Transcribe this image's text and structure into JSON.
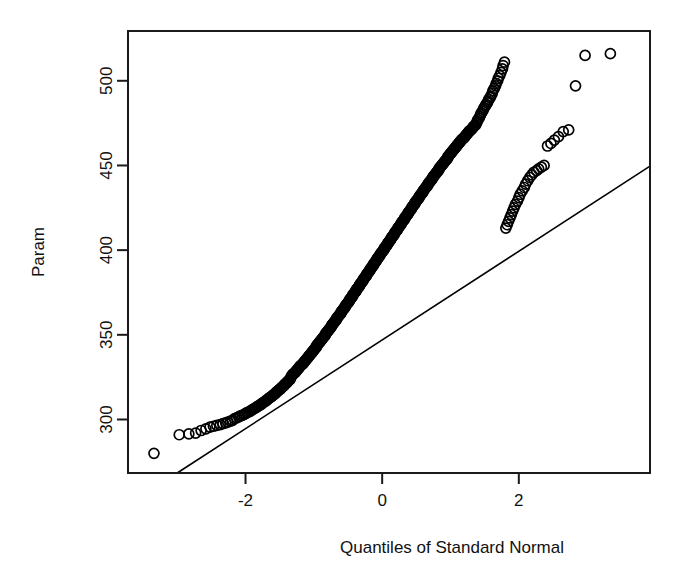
{
  "figure": {
    "background": "#ffffff",
    "ink_color": "#000000",
    "width": 687,
    "height": 584
  },
  "chart_data": {
    "type": "scatter",
    "title": "",
    "subtitle": "",
    "xlabel": "Quantiles of Standard Normal",
    "ylabel": "Param",
    "xlim": [
      -3.72,
      3.92
    ],
    "ylim": [
      268.4,
      529.4
    ],
    "xticks": [
      -2,
      0,
      2
    ],
    "xtick_labels": [
      "-2",
      "0",
      "2"
    ],
    "yticks": [
      300,
      350,
      400,
      450,
      500
    ],
    "ytick_labels": [
      "300",
      "350",
      "400",
      "450",
      "500"
    ],
    "grid": false,
    "legend": null,
    "marker": {
      "shape": "open-circle",
      "radius_px": 5,
      "fill": "none",
      "stroke": "#000000"
    },
    "reference_line": {
      "description": "qqline through first and third quartiles",
      "x_endpoints": [
        -3.0,
        3.92
      ],
      "y_endpoints": [
        268.4,
        449.6
      ],
      "slope": 26.15,
      "intercept": 346.9,
      "color": "#000000"
    },
    "annotations": [],
    "n_points": 360,
    "series": [
      {
        "name": "Param sample quantiles",
        "x": [
          -3.34,
          -2.97,
          -2.83,
          -2.73,
          -2.65,
          -2.58,
          -2.52,
          -2.47,
          -2.42,
          -2.37,
          -2.33,
          -2.29,
          -2.26,
          -2.22,
          -2.19,
          -2.16,
          -2.13,
          -2.1,
          -2.08,
          -2.05,
          -2.02,
          -2.0,
          -1.98,
          -1.95,
          -1.93,
          -1.91,
          -1.89,
          -1.87,
          -1.85,
          -1.83,
          -1.81,
          -1.79,
          -1.77,
          -1.76,
          -1.74,
          -1.72,
          -1.7,
          -1.69,
          -1.67,
          -1.66,
          -1.64,
          -1.62,
          -1.61,
          -1.59,
          -1.58,
          -1.56,
          -1.55,
          -1.54,
          -1.52,
          -1.51,
          -1.49,
          -1.48,
          -1.47,
          -1.45,
          -1.44,
          -1.43,
          -1.42,
          -1.4,
          -1.39,
          -1.38,
          -1.37,
          -1.35,
          -1.34,
          -1.33,
          -1.32,
          -1.31,
          -1.3,
          -1.28,
          -1.27,
          -1.26,
          -1.25,
          -1.24,
          -1.23,
          -1.22,
          -1.21,
          -1.2,
          -1.19,
          -1.17,
          -1.16,
          -1.15,
          -1.14,
          -1.13,
          -1.12,
          -1.11,
          -1.1,
          -1.09,
          -1.08,
          -1.07,
          -1.06,
          -1.05,
          -1.04,
          -1.03,
          -1.02,
          -1.01,
          -1.0,
          -0.99,
          -0.98,
          -0.97,
          -0.96,
          -0.96,
          -0.95,
          -0.94,
          -0.93,
          -0.92,
          -0.91,
          -0.9,
          -0.89,
          -0.88,
          -0.87,
          -0.86,
          -0.85,
          -0.84,
          -0.83,
          -0.83,
          -0.82,
          -0.81,
          -0.8,
          -0.79,
          -0.78,
          -0.77,
          -0.76,
          -0.75,
          -0.74,
          -0.74,
          -0.73,
          -0.72,
          -0.71,
          -0.7,
          -0.69,
          -0.68,
          -0.67,
          -0.67,
          -0.66,
          -0.65,
          -0.64,
          -0.63,
          -0.62,
          -0.61,
          -0.6,
          -0.6,
          -0.59,
          -0.58,
          -0.57,
          -0.56,
          -0.55,
          -0.54,
          -0.54,
          -0.53,
          -0.52,
          -0.51,
          -0.5,
          -0.49,
          -0.48,
          -0.48,
          -0.47,
          -0.46,
          -0.45,
          -0.44,
          -0.43,
          -0.43,
          -0.42,
          -0.41,
          -0.4,
          -0.39,
          -0.38,
          -0.38,
          -0.37,
          -0.36,
          -0.35,
          -0.34,
          -0.33,
          -0.33,
          -0.32,
          -0.31,
          -0.3,
          -0.29,
          -0.28,
          -0.28,
          -0.27,
          -0.26,
          -0.25,
          -0.24,
          -0.23,
          -0.23,
          -0.22,
          -0.21,
          -0.2,
          -0.19,
          -0.18,
          -0.18,
          -0.17,
          -0.16,
          -0.15,
          -0.14,
          -0.13,
          -0.13,
          -0.12,
          -0.11,
          -0.1,
          -0.09,
          -0.08,
          -0.08,
          -0.07,
          -0.06,
          -0.05,
          -0.04,
          -0.03,
          -0.03,
          -0.02,
          -0.01,
          0.0,
          0.01,
          0.02,
          0.03,
          0.03,
          0.04,
          0.05,
          0.06,
          0.07,
          0.08,
          0.08,
          0.09,
          0.1,
          0.11,
          0.12,
          0.13,
          0.13,
          0.14,
          0.15,
          0.16,
          0.17,
          0.18,
          0.18,
          0.19,
          0.2,
          0.21,
          0.22,
          0.23,
          0.23,
          0.24,
          0.25,
          0.26,
          0.27,
          0.28,
          0.28,
          0.29,
          0.3,
          0.31,
          0.32,
          0.33,
          0.33,
          0.34,
          0.35,
          0.36,
          0.37,
          0.38,
          0.38,
          0.39,
          0.4,
          0.41,
          0.42,
          0.43,
          0.43,
          0.44,
          0.45,
          0.46,
          0.47,
          0.48,
          0.48,
          0.49,
          0.5,
          0.51,
          0.52,
          0.53,
          0.54,
          0.54,
          0.55,
          0.56,
          0.57,
          0.58,
          0.59,
          0.6,
          0.6,
          0.61,
          0.62,
          0.63,
          0.64,
          0.65,
          0.66,
          0.67,
          0.67,
          0.68,
          0.69,
          0.7,
          0.71,
          0.72,
          0.73,
          0.74,
          0.74,
          0.75,
          0.76,
          0.77,
          0.78,
          0.79,
          0.8,
          0.81,
          0.82,
          0.83,
          0.83,
          0.84,
          0.85,
          0.86,
          0.87,
          0.88,
          0.89,
          0.9,
          0.91,
          0.92,
          0.93,
          0.94,
          0.95,
          0.96,
          0.96,
          0.97,
          0.98,
          0.99,
          1.0,
          1.01,
          1.02,
          1.03,
          1.04,
          1.05,
          1.06,
          1.07,
          1.08,
          1.09,
          1.1,
          1.11,
          1.12,
          1.13,
          1.14,
          1.15,
          1.16,
          1.17,
          1.19,
          1.2,
          1.21,
          1.22,
          1.23,
          1.24,
          1.25,
          1.26,
          1.27,
          1.28,
          1.3,
          1.31,
          1.32,
          1.33,
          1.34,
          1.35,
          1.37,
          1.38,
          1.39,
          1.4,
          1.42,
          1.43,
          1.44,
          1.45,
          1.47,
          1.48,
          1.49,
          1.51,
          1.52,
          1.54,
          1.55,
          1.56,
          1.58,
          1.59,
          1.61,
          1.62,
          1.64,
          1.66,
          1.67,
          1.69,
          1.7,
          1.72,
          1.74,
          1.76,
          1.77,
          1.79,
          1.81,
          1.83,
          1.85,
          1.87,
          1.89,
          1.91,
          1.93,
          1.95,
          1.98,
          2.0,
          2.02,
          2.05,
          2.08,
          2.1,
          2.13,
          2.16,
          2.19,
          2.22,
          2.26,
          2.29,
          2.33,
          2.37,
          2.42,
          2.47,
          2.52,
          2.58,
          2.65,
          2.73,
          2.83,
          2.97,
          3.34
        ],
        "y": [
          280.0,
          291.0,
          291.5,
          292.0,
          293.5,
          294.5,
          295.5,
          296.0,
          296.5,
          297.0,
          297.5,
          298.0,
          298.5,
          299.0,
          299.5,
          300.5,
          301.0,
          301.5,
          302.0,
          302.5,
          303.0,
          303.5,
          304.0,
          304.5,
          305.0,
          305.5,
          306.0,
          306.5,
          307.0,
          307.5,
          308.0,
          308.5,
          309.0,
          309.5,
          310.0,
          310.5,
          311.0,
          311.5,
          312.0,
          312.5,
          313.0,
          313.5,
          314.0,
          314.5,
          315.0,
          315.5,
          316.0,
          316.5,
          317.0,
          317.5,
          318.0,
          318.5,
          319.0,
          319.5,
          320.0,
          320.5,
          321.0,
          321.5,
          322.0,
          322.5,
          323.0,
          323.5,
          324.5,
          325.5,
          326.0,
          326.5,
          327.0,
          327.5,
          328.0,
          328.5,
          329.0,
          329.5,
          330.0,
          330.5,
          331.0,
          331.5,
          332.0,
          332.5,
          333.0,
          333.5,
          334.0,
          334.5,
          335.0,
          335.5,
          336.0,
          336.5,
          337.0,
          337.5,
          338.0,
          338.5,
          339.0,
          339.5,
          340.0,
          340.5,
          341.0,
          341.5,
          342.0,
          342.5,
          343.0,
          343.5,
          344.0,
          344.5,
          345.0,
          345.5,
          346.0,
          346.5,
          347.0,
          347.5,
          348.0,
          348.5,
          349.0,
          349.5,
          350.0,
          350.5,
          351.0,
          351.5,
          352.0,
          352.5,
          353.0,
          353.5,
          354.0,
          354.5,
          355.0,
          355.5,
          356.0,
          356.5,
          357.0,
          357.5,
          358.0,
          358.5,
          359.0,
          359.5,
          360.0,
          360.5,
          361.0,
          361.5,
          362.0,
          362.5,
          363.0,
          363.5,
          364.0,
          364.5,
          365.0,
          365.5,
          366.0,
          366.5,
          367.0,
          367.5,
          368.0,
          368.5,
          369.0,
          369.5,
          370.0,
          370.5,
          371.0,
          371.5,
          372.0,
          372.5,
          373.0,
          373.5,
          374.0,
          374.5,
          375.0,
          375.5,
          376.0,
          376.5,
          377.0,
          377.5,
          378.0,
          378.5,
          379.0,
          379.5,
          380.0,
          380.5,
          381.0,
          381.5,
          382.0,
          382.5,
          383.0,
          383.5,
          384.0,
          384.5,
          385.0,
          385.5,
          386.0,
          386.5,
          387.0,
          387.5,
          388.0,
          388.5,
          389.0,
          389.5,
          390.0,
          390.5,
          391.0,
          391.5,
          392.0,
          392.5,
          393.0,
          393.5,
          394.0,
          394.5,
          395.0,
          395.5,
          396.0,
          396.5,
          397.0,
          397.5,
          398.0,
          398.5,
          399.0,
          399.5,
          400.0,
          400.5,
          401.0,
          401.5,
          402.0,
          402.5,
          403.0,
          403.5,
          404.0,
          404.5,
          405.0,
          405.5,
          406.0,
          406.5,
          407.0,
          407.5,
          408.0,
          408.5,
          409.0,
          409.5,
          410.0,
          410.5,
          411.0,
          411.5,
          412.0,
          412.5,
          413.0,
          413.5,
          414.0,
          414.5,
          415.0,
          415.5,
          416.0,
          416.5,
          417.0,
          417.5,
          418.0,
          418.5,
          419.0,
          419.5,
          420.0,
          420.5,
          421.0,
          421.5,
          422.0,
          422.5,
          423.0,
          423.5,
          424.0,
          424.5,
          425.0,
          425.5,
          426.0,
          426.5,
          427.0,
          427.5,
          428.0,
          428.5,
          429.0,
          429.5,
          430.0,
          430.5,
          431.0,
          431.5,
          432.0,
          432.5,
          433.0,
          433.5,
          434.0,
          434.5,
          435.0,
          435.5,
          436.0,
          436.5,
          437.0,
          437.5,
          438.0,
          438.5,
          439.0,
          439.5,
          440.0,
          440.5,
          441.0,
          441.5,
          442.0,
          442.5,
          443.0,
          443.5,
          444.0,
          444.5,
          445.0,
          445.5,
          446.0,
          446.5,
          447.0,
          447.5,
          448.0,
          448.5,
          449.0,
          449.5,
          450.0,
          450.5,
          451.0,
          451.5,
          452.0,
          452.5,
          453.0,
          453.5,
          454.0,
          454.5,
          455.0,
          455.5,
          456.0,
          456.5,
          457.0,
          457.5,
          458.0,
          458.5,
          459.0,
          459.5,
          460.0,
          460.5,
          461.0,
          461.5,
          462.0,
          462.5,
          463.0,
          463.5,
          464.0,
          464.5,
          465.0,
          465.5,
          466.0,
          466.5,
          467.0,
          467.5,
          468.0,
          468.5,
          469.0,
          469.5,
          470.0,
          470.5,
          471.0,
          471.5,
          472.0,
          472.5,
          473.0,
          473.5,
          474.0,
          475.0,
          476.0,
          477.0,
          478.0,
          479.0,
          480.0,
          481.0,
          482.0,
          483.0,
          484.0,
          485.0,
          486.0,
          487.0,
          488.0,
          489.0,
          490.0,
          491.0,
          492.5,
          494.0,
          495.5,
          497.0,
          498.5,
          500.0,
          501.5,
          503.0,
          505.0,
          507.0,
          509.0,
          511.0,
          413.0,
          415.0,
          417.0,
          419.0,
          421.0,
          423.0,
          425.0,
          427.0,
          429.0,
          431.0,
          433.0,
          435.0,
          437.0,
          439.0,
          441.0,
          443.0,
          444.5,
          446.0,
          447.0,
          448.0,
          449.0,
          450.0,
          461.5,
          463.0,
          465.0,
          467.0,
          470.0,
          471.0,
          497.0,
          515.0,
          516.0
        ]
      }
    ]
  },
  "axes": {
    "ylabel_text": "Param",
    "xlabel_text": "Quantiles of Standard Normal"
  }
}
